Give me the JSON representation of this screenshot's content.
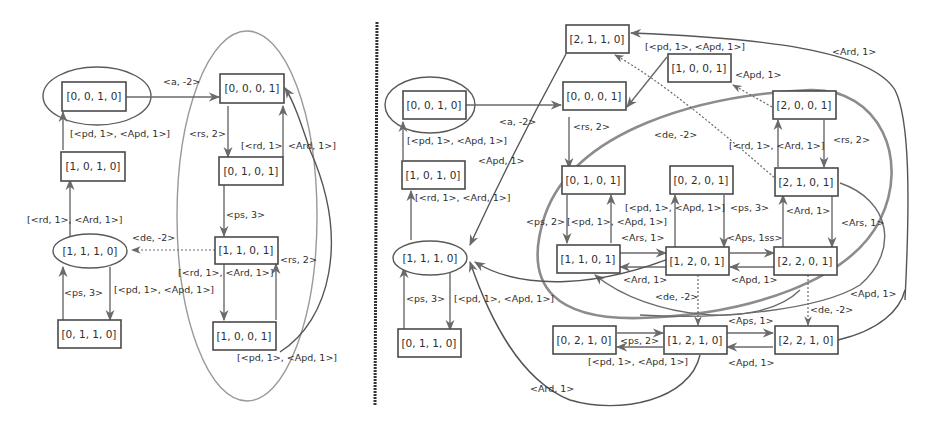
{
  "left_graph": {
    "nodes": {
      "n0010": "[0, 0, 1, 0]",
      "n0001": "[0, 0, 0, 1]",
      "n1010": "[1, 0, 1, 0]",
      "n0101": "[0, 1, 0, 1]",
      "n1110": "[1, 1, 1, 0]",
      "n1101": "[1, 1, 0, 1]",
      "n0110": "[0, 1, 1, 0]",
      "n1001": "[1, 0, 0, 1]"
    },
    "labels": {
      "a_m2": "<a, -2>",
      "pd_apd_top": "[<pd, 1>, <Apd, 1>]",
      "rs2_top": "<rs, 2>",
      "rd_ard_right": "[<rd, 1>",
      "ard_right": "<Ard, 1>]",
      "rd_ard_left": "[<rd, 1>, <Ard, 1>]",
      "ps3_right": "<ps, 3>",
      "de_m2": "<de, -2>",
      "rs2_mid": "<rs, 2>",
      "rd_ard_mid": "[<rd, 1>, <Ard, 1>]",
      "ps3_left": "<ps, 3>",
      "pd_apd_mid": "[<pd, 1>, <Apd, 1>]",
      "pd_apd_bottom": "[<pd, 1>, <Apd, 1>]"
    }
  },
  "right_graph": {
    "nodes": {
      "n2110": "[2, 1, 1, 0]",
      "n0010": "[0, 0, 1, 0]",
      "n0001": "[0, 0, 0, 1]",
      "n1001": "[1, 0, 0, 1]",
      "n2001": "[2, 0, 0, 1]",
      "n1010": "[1, 0, 1, 0]",
      "n0101": "[0, 1, 0, 1]",
      "n0201": "[0, 2, 0, 1]",
      "n2101": "[2, 1, 0, 1]",
      "n1110": "[1, 1, 1, 0]",
      "n1101": "[1, 1, 0, 1]",
      "n1201": "[1, 2, 0, 1]",
      "n2201": "[2, 2, 0, 1]",
      "n0110": "[0, 1, 1, 0]",
      "n0210": "[0, 2, 1, 0]",
      "n1210": "[1, 2, 1, 0]",
      "n2210": "[2, 2, 1, 0]"
    },
    "labels": {
      "pd_apd_top": "[<pd, 1>, <Apd, 1>]",
      "ard_top": "<Ard, 1>",
      "apd_1001": "<Apd, 1>",
      "a_m2": "<a, -2>",
      "pd_apd_left": "[<pd, 1>, <Apd, 1>]",
      "rs2_left": "<rs, 2>",
      "de_m2_top": "<de, -2>",
      "rs2_right": "<rs, 2>",
      "rd_ard_right": "[<rd, 1>, <Ard, 1>]",
      "apd_curve": "<Apd, 1>",
      "rd_ard_left": "[<rd, 1>, <Ard, 1>]",
      "ps2": "<ps, 2>",
      "pd_apd_0101": "[<pd, 1>, <Apd, 1>]",
      "pd_apd_0201": "[<pd, 1>, <Apd, 1>]",
      "ps3_0201": "<ps, 3>",
      "ard_2101": "<Ard, 1>",
      "ars_2101": "<Ars, 1>",
      "ars_1101": "<Ars, 1>",
      "aps_1ss": "<Aps, 1ss>",
      "ard_1201": "<Ard, 1>",
      "apd_2201": "<Apd, 1>",
      "de_m2_1201": "<de, -2>",
      "de_m2_2201": "<de, -2>",
      "apd_far": "<Apd, 1>",
      "ps3_left": "<ps, 3>",
      "pd_apd_1110": "[<pd, 1>, <Apd, 1>]",
      "aps_1210": "<Aps, 1>",
      "ps2_0210": "<ps, 2>",
      "pd_apd_0210": "[<pd, 1>, <Apd, 1>]",
      "apd_1210": "<Apd, 1>",
      "ard_bottom": "<Ard, 1>"
    }
  }
}
